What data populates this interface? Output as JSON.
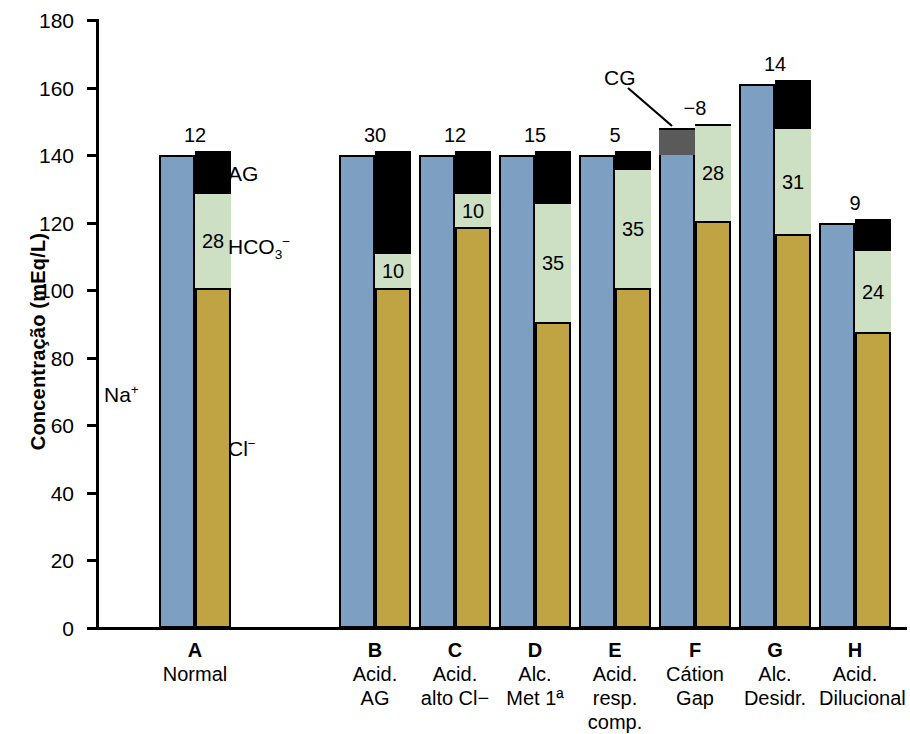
{
  "chart_data": {
    "type": "bar",
    "title": "",
    "xlabel": "",
    "ylabel": "Concentração (mEq/L)",
    "ylim": [
      0,
      180
    ],
    "yticks": [
      0,
      20,
      40,
      60,
      80,
      100,
      120,
      140,
      160,
      180
    ],
    "ytick_labels": [
      "0",
      "20",
      "40",
      "60",
      "80",
      "100",
      "120",
      "140",
      "160",
      "180"
    ],
    "grid": false,
    "legend": "in-plot annotations",
    "annotations": [
      "Na+",
      "Cl-",
      "HCO3-",
      "AG",
      "CG"
    ],
    "series": [
      {
        "name": "Na+",
        "values": [
          140,
          140,
          140,
          140,
          140,
          140,
          161,
          120
        ]
      },
      {
        "name": "CG",
        "values": [
          0,
          0,
          0,
          0,
          0,
          8,
          0,
          0
        ]
      },
      {
        "name": "Cl-",
        "values": [
          100,
          100,
          118,
          90,
          100,
          120,
          116,
          87
        ]
      },
      {
        "name": "HCO3-",
        "values": [
          28,
          10,
          10,
          35,
          35,
          28,
          31,
          24
        ]
      },
      {
        "name": "AG",
        "values": [
          12,
          30,
          12,
          15,
          5,
          -8,
          14,
          9
        ]
      }
    ],
    "categories": [
      "A",
      "B",
      "C",
      "D",
      "E",
      "F",
      "G",
      "H"
    ],
    "category_captions": [
      "Normal",
      "Acid. AG",
      "Acid. alto Cl−",
      "Alc. Met 1ª",
      "Acid. resp. comp.",
      "Cátion Gap",
      "Alc. Desidr.",
      "Acid. Dilucional"
    ]
  },
  "axis": {
    "y_title": "Concentração (mEq/L)",
    "y_ticks": [
      "180",
      "160",
      "140",
      "120",
      "100",
      "80",
      "60",
      "40",
      "20",
      "0"
    ]
  },
  "annotations": {
    "na": "Na",
    "na_sup": "+",
    "cl": "Cl",
    "cl_sup": "−",
    "hco3": "HCO",
    "hco3_sub": "3",
    "hco3_sup": "−",
    "ag": "AG",
    "cg": "CG"
  },
  "colors": {
    "sodium": "#7d9fc2",
    "bicarbonate": "#cde0c4",
    "chloride": "#c0a443",
    "anion_gap": "#000000",
    "cation_gap": "#5a5a5a",
    "outline": "#000000",
    "background": "#ffffff"
  },
  "bars": [
    {
      "key": "A",
      "letter": "A",
      "caption_lines": [
        "Normal"
      ],
      "total_label": "12",
      "na_value": 140,
      "na_label": "",
      "cg_value": 0,
      "cl_value": 100,
      "hco3_value": 28,
      "hco3_label": "28",
      "ag_value": 12
    },
    {
      "key": "B",
      "letter": "B",
      "caption_lines": [
        "Acid.",
        "AG"
      ],
      "total_label": "30",
      "na_value": 140,
      "na_label": "",
      "cg_value": 0,
      "cl_value": 100,
      "hco3_value": 10,
      "hco3_label": "10",
      "ag_value": 30
    },
    {
      "key": "C",
      "letter": "C",
      "caption_lines": [
        "Acid.",
        "alto Cl−"
      ],
      "total_label": "12",
      "na_value": 140,
      "na_label": "",
      "cg_value": 0,
      "cl_value": 118,
      "hco3_value": 10,
      "hco3_label": "10",
      "ag_value": 12
    },
    {
      "key": "D",
      "letter": "D",
      "caption_lines": [
        "Alc.",
        "Met 1ª"
      ],
      "total_label": "15",
      "na_value": 140,
      "na_label": "",
      "cg_value": 0,
      "cl_value": 90,
      "hco3_value": 35,
      "hco3_label": "35",
      "ag_value": 15
    },
    {
      "key": "E",
      "letter": "E",
      "caption_lines": [
        "Acid.",
        "resp.",
        "comp."
      ],
      "total_label": "5",
      "na_value": 140,
      "na_label": "",
      "cg_value": 0,
      "cl_value": 100,
      "hco3_value": 35,
      "hco3_label": "35",
      "ag_value": 5
    },
    {
      "key": "F",
      "letter": "F",
      "caption_lines": [
        "Cátion",
        "Gap"
      ],
      "total_label": "−8",
      "na_value": 140,
      "na_label": "",
      "cg_value": 8,
      "cl_value": 120,
      "hco3_value": 28,
      "hco3_label": "28",
      "ag_value": 0
    },
    {
      "key": "G",
      "letter": "G",
      "caption_lines": [
        "Alc.",
        "Desidr."
      ],
      "total_label": "14",
      "na_value": 161,
      "na_label": "",
      "cg_value": 0,
      "cl_value": 116,
      "hco3_value": 31,
      "hco3_label": "31",
      "ag_value": 14
    },
    {
      "key": "H",
      "letter": "H",
      "caption_lines": [
        "Acid.",
        "Dilucional"
      ],
      "total_label": "9",
      "na_value": 120,
      "na_label": "",
      "cg_value": 0,
      "cl_value": 87,
      "hco3_value": 24,
      "hco3_label": "24",
      "ag_value": 9
    }
  ]
}
